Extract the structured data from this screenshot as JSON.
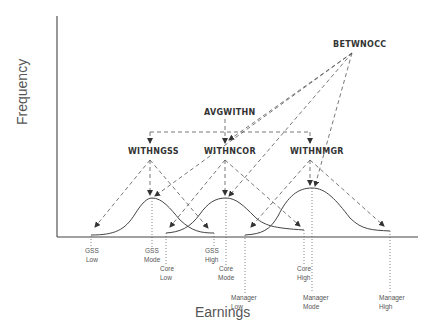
{
  "diagram": {
    "axes": {
      "y_label": "Frequency",
      "x_label": "Earnings"
    },
    "nodes": {
      "betwnocc": "BETWNOCC",
      "avgwithn": "AVGWITHN",
      "withngss": "WITHNGSS",
      "withncor": "WITHNCOR",
      "withnmgr": "WITHNMGR"
    },
    "distributions": [
      {
        "name": "GSS",
        "low": "GSS Low",
        "mode": "GSS Mode",
        "high": "GSS High"
      },
      {
        "name": "Core",
        "low": "Core Low",
        "mode": "Core Mode",
        "high": "Core High"
      },
      {
        "name": "Manager",
        "low": "Manager Low",
        "mode": "Manager Mode",
        "high": "Manager High"
      }
    ],
    "ticks": [
      {
        "line1": "GSS",
        "line2": "Low"
      },
      {
        "line1": "GSS",
        "line2": "Mode"
      },
      {
        "line1": "Core",
        "line2": "Low"
      },
      {
        "line1": "GSS",
        "line2": "High"
      },
      {
        "line1": "Core",
        "line2": "Mode"
      },
      {
        "line1": "Manager",
        "line2": "Low"
      },
      {
        "line1": "Core",
        "line2": "High"
      },
      {
        "line1": "Manager",
        "line2": "Mode"
      },
      {
        "line1": "Manager",
        "line2": "High"
      }
    ]
  }
}
